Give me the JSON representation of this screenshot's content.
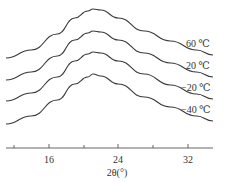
{
  "chart_data": {
    "type": "line",
    "title": "",
    "xlabel": "2θ(°)",
    "ylabel": "",
    "xlim": [
      11,
      35
    ],
    "x_ticks": [
      16,
      24,
      32
    ],
    "x_minor_ticks": [
      12,
      20,
      28
    ],
    "grid": false,
    "legend": "inline labels at right end of curves",
    "series": [
      {
        "name": "60 ℃",
        "offset_rank": 1,
        "x": [
          11.1,
          14,
          17,
          19,
          20.5,
          21.1,
          22,
          24,
          27,
          30,
          33,
          34.9
        ],
        "y_px": [
          58,
          50,
          34,
          18,
          11,
          9,
          10,
          18,
          31,
          41,
          50,
          55
        ]
      },
      {
        "name": "20 ℃",
        "offset_rank": 2,
        "x": [
          11.1,
          14,
          17,
          19,
          20.5,
          21.1,
          22,
          24,
          27,
          30,
          33,
          34.9
        ],
        "y_px": [
          80,
          72,
          56,
          40,
          33,
          31,
          32,
          40,
          53,
          63,
          72,
          77
        ]
      },
      {
        "name": "−20 ℃",
        "offset_rank": 3,
        "x": [
          11.1,
          14,
          17,
          19,
          20.5,
          21.1,
          22,
          24,
          27,
          30,
          33,
          34.9
        ],
        "y_px": [
          101,
          93,
          77,
          61,
          54,
          52,
          53,
          61,
          74,
          85,
          94,
          99
        ]
      },
      {
        "name": "−40 ℃",
        "offset_rank": 4,
        "x": [
          11.1,
          14,
          17,
          19,
          20.5,
          21.1,
          22,
          24,
          27,
          30,
          33,
          34.9
        ],
        "y_px": [
          124,
          116,
          100,
          84,
          77,
          74,
          76,
          84,
          97,
          107,
          116,
          121
        ]
      }
    ],
    "peak_position_2theta": 21.1
  },
  "labels": {
    "s0": "60 ℃",
    "s1": "20 ℃",
    "s2": "−20 ℃",
    "s3": "−40 ℃",
    "t16": "16",
    "t24": "24",
    "t32": "32",
    "xlabel": "2θ(°)"
  }
}
